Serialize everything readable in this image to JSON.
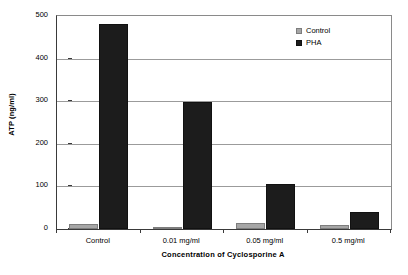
{
  "chart_data": {
    "type": "bar",
    "title": "",
    "xlabel": "Concentration of Cyclosporine A",
    "ylabel": "ATP (ng/ml)",
    "categories": [
      "Control",
      "0.01 mg/ml",
      "0.05 mg/ml",
      "0.5 mg/ml"
    ],
    "series": [
      {
        "name": "Control",
        "color": "#a6a6a6",
        "values": [
          12,
          4,
          15,
          10
        ]
      },
      {
        "name": "PHA",
        "color": "#1c1c1c",
        "values": [
          482,
          298,
          105,
          40
        ]
      }
    ],
    "ylim": [
      0,
      500
    ],
    "yticks": [
      0,
      100,
      200,
      300,
      400,
      500
    ],
    "ytick_labels": [
      "0",
      "100",
      "200",
      "300",
      "400",
      "500"
    ],
    "grid": "horizontal",
    "legend_position": "top-right"
  },
  "legend": {
    "entries": [
      {
        "label": "Control",
        "swatch": "gray-square-icon"
      },
      {
        "label": "PHA",
        "swatch": "black-square-icon"
      }
    ]
  }
}
